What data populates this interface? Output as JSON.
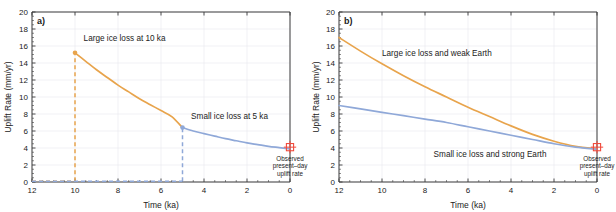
{
  "figure": {
    "width": 616,
    "height": 212,
    "background": "#ffffff"
  },
  "colors": {
    "orange": "#e8a44c",
    "blue": "#8fa8d8",
    "red": "#f04a3c",
    "axis": "#3c3c3c",
    "grid": "#e8e8ee",
    "text": "#222222"
  },
  "axes": {
    "x": {
      "label": "Time (ka)",
      "min": 0,
      "max": 12,
      "reversed": true,
      "ticks": [
        12,
        10,
        8,
        6,
        4,
        2,
        0
      ],
      "tick_labels": [
        "12",
        "10",
        "8",
        "6",
        "4",
        "2",
        "0"
      ],
      "minor_step": 0.5
    },
    "y": {
      "label": "Uplift Rate (mm/yr)",
      "min": 0,
      "max": 20,
      "ticks": [
        0,
        2,
        4,
        6,
        8,
        10,
        12,
        14,
        16,
        18,
        20
      ],
      "tick_labels": [
        "0",
        "2",
        "4",
        "6",
        "8",
        "10",
        "12",
        "14",
        "16",
        "18",
        "20"
      ],
      "minor_step": 0.5
    }
  },
  "chart_data": [
    {
      "type": "line",
      "panel": "a",
      "panel_letter": "a)",
      "title": "",
      "xlabel": "Time (ka)",
      "ylabel": "Uplift Rate (mm/yr)",
      "xlim": [
        12,
        0
      ],
      "ylim": [
        0,
        20
      ],
      "grid": true,
      "legend": "inline-annotations",
      "series": [
        {
          "name": "Large ice loss at 10 ka",
          "color": "#e8a44c",
          "style": "solid",
          "x": [
            10,
            9.5,
            9,
            8.5,
            8,
            7.5,
            7,
            6.5,
            6,
            5.5,
            5
          ],
          "y": [
            15.2,
            14.2,
            13.2,
            12.3,
            11.4,
            10.6,
            9.8,
            9.1,
            8.4,
            7.7,
            6.4
          ]
        },
        {
          "name": "Large ice loss at 10 ka (pre-event baseline)",
          "color": "#e8a44c",
          "style": "dashed",
          "x": [
            12,
            10
          ],
          "y": [
            0.1,
            0.1
          ]
        },
        {
          "name": "Large ice loss at 10 ka (rise)",
          "color": "#e8a44c",
          "style": "dashed",
          "x": [
            10,
            10
          ],
          "y": [
            0.1,
            15.2
          ]
        },
        {
          "name": "Small ice loss at 5 ka",
          "color": "#8fa8d8",
          "style": "solid",
          "x": [
            5,
            4.5,
            4,
            3.5,
            3,
            2.5,
            2,
            1.5,
            1,
            0.5,
            0
          ],
          "y": [
            6.4,
            6.0,
            5.7,
            5.4,
            5.1,
            4.85,
            4.6,
            4.4,
            4.2,
            4.05,
            3.9
          ]
        },
        {
          "name": "Small ice loss at 5 ka (pre-event baseline)",
          "color": "#8fa8d8",
          "style": "dashed",
          "x": [
            12,
            5
          ],
          "y": [
            0.1,
            0.1
          ]
        },
        {
          "name": "Small ice loss at 5 ka (rise)",
          "color": "#8fa8d8",
          "style": "dashed",
          "x": [
            5,
            5
          ],
          "y": [
            0.1,
            6.4
          ]
        }
      ],
      "markers": [
        {
          "name": "large-ice-loss-peak",
          "x": 10,
          "y": 15.2,
          "color": "#e8a44c",
          "shape": "circle"
        },
        {
          "name": "small-ice-loss-peak",
          "x": 5,
          "y": 6.4,
          "color": "#8fa8d8",
          "shape": "circle"
        }
      ],
      "annotations": [
        {
          "name": "large-ice-loss-label",
          "text": "Large ice loss at 10 ka",
          "x": 9.6,
          "y": 17.0,
          "color": "#e8a44c",
          "anchor": "start"
        },
        {
          "name": "small-ice-loss-label",
          "text": "Small ice loss at 5 ka",
          "x": 4.6,
          "y": 7.8,
          "color": "#8fa8d8",
          "anchor": "start"
        }
      ],
      "observed": {
        "name": "observed-present-day-uplift-rate",
        "x": 0,
        "y": 4.1,
        "color": "#f04a3c",
        "marker": "square-with-error-bars",
        "label_lines": [
          "Observed",
          "present–day",
          "uplift rate"
        ]
      }
    },
    {
      "type": "line",
      "panel": "b",
      "panel_letter": "b)",
      "title": "",
      "xlabel": "Time (ka)",
      "ylabel": "Uplift Rate (mm/yr)",
      "xlim": [
        12,
        0
      ],
      "ylim": [
        0,
        20
      ],
      "grid": true,
      "legend": "inline-annotations",
      "series": [
        {
          "name": "Large ice loss and weak Earth",
          "color": "#e8a44c",
          "style": "solid",
          "x": [
            12,
            11,
            10,
            9,
            8,
            7,
            6,
            5,
            4,
            3,
            2,
            1,
            0
          ],
          "y": [
            17.0,
            15.4,
            13.9,
            12.5,
            11.2,
            10.0,
            8.8,
            7.7,
            6.6,
            5.6,
            4.8,
            4.2,
            3.9
          ]
        },
        {
          "name": "Small ice loss and strong Earth",
          "color": "#8fa8d8",
          "style": "solid",
          "x": [
            12,
            11,
            10,
            9,
            8,
            7,
            6,
            5,
            4,
            3,
            2,
            1,
            0
          ],
          "y": [
            9.0,
            8.6,
            8.2,
            7.8,
            7.4,
            7.0,
            6.5,
            6.0,
            5.5,
            5.0,
            4.5,
            4.1,
            3.85
          ]
        }
      ],
      "markers": [],
      "annotations": [
        {
          "name": "large-ice-weak-earth-label",
          "text": "Large ice loss and weak Earth",
          "x": 10.0,
          "y": 15.2,
          "color": "#e8a44c",
          "anchor": "start"
        },
        {
          "name": "small-ice-strong-earth-label",
          "text": "Small ice loss and strong Earth",
          "x": 7.6,
          "y": 3.3,
          "color": "#8fa8d8",
          "anchor": "start"
        }
      ],
      "observed": {
        "name": "observed-present-day-uplift-rate",
        "x": 0,
        "y": 4.1,
        "color": "#f04a3c",
        "marker": "square-with-error-bars",
        "label_lines": [
          "Observed",
          "present–day",
          "uplift rate"
        ]
      }
    }
  ]
}
